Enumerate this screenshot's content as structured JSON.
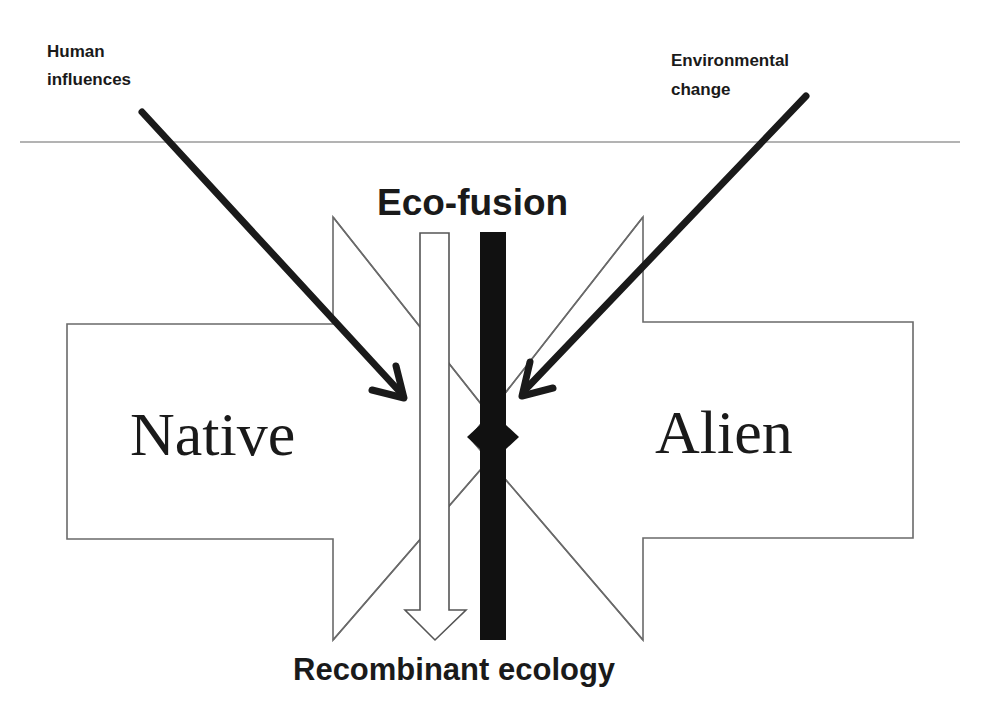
{
  "labels": {
    "human_influences_line1": "Human",
    "human_influences_line2": "influences",
    "environmental_change_line1": "Environmental",
    "environmental_change_line2": "change",
    "eco_fusion": "Eco-fusion",
    "native": "Native",
    "alien": "Alien",
    "recombinant_ecology": "Recombinant ecology"
  },
  "colors": {
    "background": "#ffffff",
    "ink": "#1a1a1a",
    "outline": "#6a6a6a",
    "bar": "#111111"
  }
}
